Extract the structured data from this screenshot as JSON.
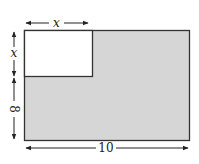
{
  "diagram": {
    "outer_rect": {
      "width_label": "10",
      "height_label_lower": "8"
    },
    "inner_square": {
      "side_label_top": "x",
      "side_label_left": "x"
    },
    "labels": {
      "top": "x",
      "left_upper": "x",
      "left_lower": "8",
      "bottom": "10"
    },
    "colors": {
      "shaded": "#d6d6d6",
      "stroke": "#333333",
      "background": "#ffffff",
      "unshaded": "#ffffff"
    }
  }
}
